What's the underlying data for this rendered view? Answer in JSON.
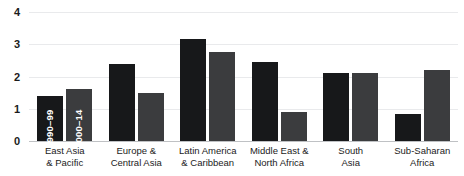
{
  "chart_data": {
    "type": "bar",
    "title": "",
    "subtitle": "",
    "xlabel": "",
    "ylabel": "",
    "ylim": [
      0,
      4
    ],
    "yticks": [
      0,
      1,
      2,
      3,
      4
    ],
    "ytick_labels": [
      "0",
      "1",
      "2",
      "3",
      "4"
    ],
    "grid": true,
    "legend_position": "inside-first-bars",
    "categories": [
      "East Asia\n& Pacific",
      "Europe &\nCentral Asia",
      "Latin America\n& Caribbean",
      "Middle East &\nNorth Africa",
      "South\nAsia",
      "Sub-Saharan\nAfrica"
    ],
    "series": [
      {
        "name": "1990–99",
        "color": "#17181a",
        "values": [
          1.4,
          2.4,
          3.15,
          2.45,
          2.1,
          0.85
        ]
      },
      {
        "name": "2000–14",
        "color": "#3b3c3e",
        "values": [
          1.6,
          1.5,
          2.75,
          0.9,
          2.1,
          2.2
        ]
      }
    ]
  },
  "axis": {
    "y_ticks": [
      "4",
      "3",
      "2",
      "1",
      "0"
    ]
  },
  "legend": {
    "series_1_label": "1990–99",
    "series_2_label": "2000–14"
  }
}
